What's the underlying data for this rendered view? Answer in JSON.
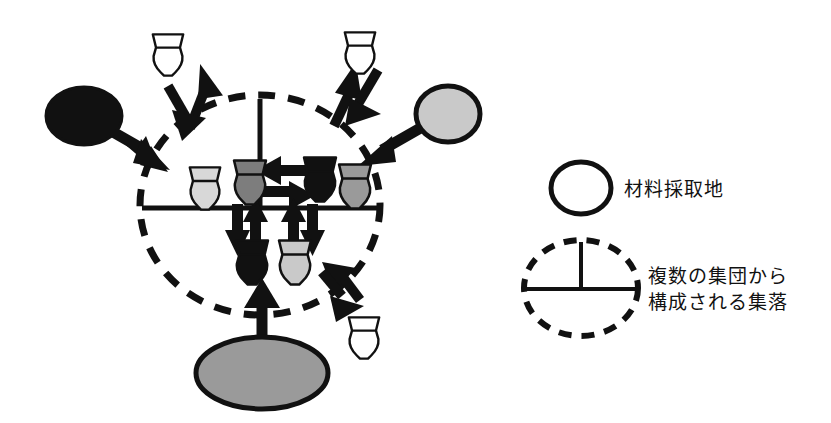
{
  "figure": {
    "kind": "archaeology-pottery-distribution-diagram",
    "background_color": "#ffffff",
    "line_color": "#111111"
  },
  "palette": {
    "black": "#111111",
    "dark_gray": "#7d7d7d",
    "medium_gray": "#9a9a9a",
    "light_gray": "#c9c9c9",
    "pale_gray": "#d8d8d8",
    "white": "#ffffff",
    "outline": "#111111"
  },
  "settlement": {
    "name": "multi-group-settlement",
    "shape": "dashed-ellipse",
    "center_x": 260,
    "center_y": 205,
    "radius_x": 120,
    "radius_y": 110,
    "divider_vertical": true,
    "divider_horizontal": true
  },
  "source_sites": [
    {
      "id": "source-left",
      "label": "material-source-left",
      "fill": "#111111",
      "cx": 84,
      "cy": 116,
      "rx": 38,
      "ry": 29,
      "arrow_to": "settlement"
    },
    {
      "id": "source-right",
      "label": "material-source-right",
      "fill": "#c9c9c9",
      "cx": 448,
      "cy": 114,
      "rx": 32,
      "ry": 28,
      "arrow_to": "settlement"
    },
    {
      "id": "source-bottom",
      "label": "material-source-bottom",
      "fill": "#9a9a9a",
      "cx": 262,
      "cy": 373,
      "rx": 66,
      "ry": 36,
      "arrow_to": "settlement"
    }
  ],
  "inner_vessels": [
    {
      "id": "vessel-inner-1",
      "fill": "#d8d8d8",
      "x": 185,
      "y": 165,
      "w": 40,
      "h": 47
    },
    {
      "id": "vessel-inner-2",
      "fill": "#7d7d7d",
      "x": 229,
      "y": 158,
      "w": 42,
      "h": 49
    },
    {
      "id": "vessel-inner-3",
      "fill": "#111111",
      "x": 299,
      "y": 155,
      "w": 42,
      "h": 49
    },
    {
      "id": "vessel-inner-4",
      "fill": "#9a9a9a",
      "x": 334,
      "y": 162,
      "w": 42,
      "h": 49
    },
    {
      "id": "vessel-inner-5",
      "fill": "#111111",
      "x": 231,
      "y": 238,
      "w": 42,
      "h": 49
    },
    {
      "id": "vessel-inner-6",
      "fill": "#c9c9c9",
      "x": 274,
      "y": 238,
      "w": 42,
      "h": 49
    }
  ],
  "outer_vessels": [
    {
      "id": "vessel-outer-topleft",
      "fill": "#ffffff",
      "x": 148,
      "y": 32,
      "w": 40,
      "h": 46
    },
    {
      "id": "vessel-outer-topright",
      "fill": "#ffffff",
      "x": 340,
      "y": 30,
      "w": 40,
      "h": 46
    },
    {
      "id": "vessel-outer-bottomright",
      "fill": "#ffffff",
      "x": 344,
      "y": 315,
      "w": 40,
      "h": 46
    }
  ],
  "exchange_arrow_pairs": [
    {
      "id": "exchange-topleft",
      "direction": "northwest-southeast"
    },
    {
      "id": "exchange-topright",
      "direction": "northeast-southwest"
    },
    {
      "id": "exchange-bottomright",
      "direction": "southeast-northwest"
    }
  ],
  "internal_arrows": [
    {
      "id": "internal-arrow-left",
      "direction": "left"
    },
    {
      "id": "internal-arrow-right",
      "direction": "right"
    },
    {
      "id": "internal-arrow-up-a",
      "direction": "up"
    },
    {
      "id": "internal-arrow-down-a",
      "direction": "down"
    },
    {
      "id": "internal-arrow-up-b",
      "direction": "up"
    },
    {
      "id": "internal-arrow-down-b",
      "direction": "down"
    }
  ],
  "legend": {
    "items": [
      {
        "id": "legend-source",
        "symbol": "solid-circle-outline",
        "label": "材料採取地"
      },
      {
        "id": "legend-settlement",
        "symbol": "dashed-circle-divided",
        "label_line1": "複数の集団から",
        "label_line2": "構成される集落"
      }
    ]
  }
}
